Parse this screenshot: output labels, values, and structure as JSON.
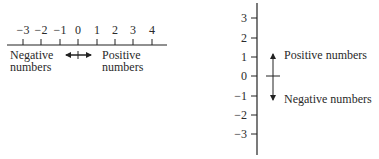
{
  "horizontal": {
    "ticks": [
      "−3",
      "−2",
      "−1",
      "0",
      "1",
      "2",
      "3",
      "4"
    ],
    "negative_label_line1": "Negative",
    "negative_label_line2": "numbers",
    "positive_label_line1": "Positive",
    "positive_label_line2": "numbers"
  },
  "vertical": {
    "ticks": [
      "3",
      "2",
      "1",
      "0",
      "−1",
      "−2",
      "−3"
    ],
    "positive_label": "Positive numbers",
    "negative_label": "Negative numbers"
  }
}
